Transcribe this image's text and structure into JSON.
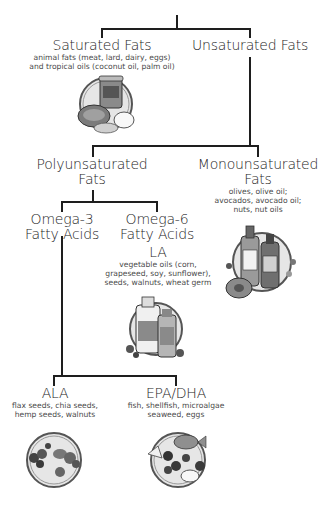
{
  "diagram": {
    "type": "tree",
    "nodes": {
      "saturated": {
        "title": "Saturated Fats",
        "desc": [
          "animal fats (meat, lard, dairy, eggs)",
          "and tropical oils (coconut oil, palm oil)"
        ],
        "illustration": "coconut-oil-steak-egg-icon",
        "jar_label": "Coconut Oil"
      },
      "unsaturated": {
        "title": "Unsaturated Fats"
      },
      "polyunsaturated": {
        "title": [
          "Polyunsaturated",
          "Fats"
        ]
      },
      "monounsaturated": {
        "title": [
          "Monounsaturated",
          "Fats"
        ],
        "desc": [
          "olives, olive oil;",
          "avocados, avocado oil;",
          "nuts, nut oils"
        ],
        "illustration": "olive-oil-avocado-icon",
        "bottle_labels": [
          "Olive Oil",
          "Avocado Oil"
        ]
      },
      "omega3": {
        "title": [
          "Omega-3",
          "Fatty Acids"
        ]
      },
      "omega6": {
        "title": [
          "Omega-6",
          "Fatty Acids"
        ]
      },
      "la": {
        "title": "LA",
        "desc": [
          "vegetable oils (corn,",
          "grapeseed, soy, sunflower),",
          "seeds, walnuts, wheat germ"
        ],
        "illustration": "vegetable-oil-corn-oil-icon",
        "bottle_labels": [
          "Vegetable Oil",
          "Corn Oil"
        ]
      },
      "ala": {
        "title": "ALA",
        "desc": [
          "flax seeds, chia seeds,",
          "hemp seeds, walnuts"
        ],
        "illustration": "seeds-walnuts-plate-icon"
      },
      "epadha": {
        "title": "EPA/DHA",
        "desc": [
          "fish, shellfish, microalgae",
          "seaweed, eggs"
        ],
        "illustration": "fish-seaweed-egg-plate-icon"
      }
    },
    "edges": [
      [
        "root",
        "saturated"
      ],
      [
        "root",
        "unsaturated"
      ],
      [
        "unsaturated",
        "polyunsaturated"
      ],
      [
        "unsaturated",
        "monounsaturated"
      ],
      [
        "polyunsaturated",
        "omega3"
      ],
      [
        "polyunsaturated",
        "omega6"
      ],
      [
        "omega6",
        "la"
      ],
      [
        "omega3",
        "ala"
      ],
      [
        "omega3",
        "epadha"
      ]
    ]
  },
  "colors": {
    "line": "#1e1e1e",
    "text": "#262626",
    "desc": "#4a4a4a",
    "illus_ring": "#6a6a6a",
    "illus_fill": "#d9d9d9"
  }
}
